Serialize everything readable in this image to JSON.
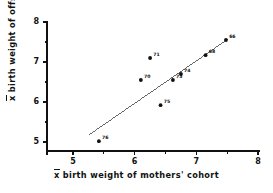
{
  "chart_data": {
    "type": "scatter",
    "title": "",
    "xlabel": "x̄ birth weight of mothers' cohort",
    "ylabel": "x̄ birth weight of offspring",
    "xlabel_parts": {
      "bar": "x",
      "rest": " birth weight of mothers' cohort"
    },
    "ylabel_parts": {
      "bar": "x",
      "rest": " birth weight of offspring"
    },
    "xlim": [
      4.7,
      8.0
    ],
    "ylim": [
      4.75,
      8.0
    ],
    "xticks": [
      5,
      6,
      7,
      8
    ],
    "yticks": [
      5,
      6,
      7,
      8
    ],
    "xtick_labels": [
      "5",
      "6",
      "7",
      "8"
    ],
    "ytick_labels": [
      "5",
      "6",
      "7",
      "8"
    ],
    "minor_ticks": true,
    "grid": false,
    "legend": "none",
    "points": [
      {
        "label": "76",
        "x": 5.42,
        "y": 5.02
      },
      {
        "label": "70",
        "x": 6.1,
        "y": 6.55
      },
      {
        "label": "71",
        "x": 6.25,
        "y": 7.1
      },
      {
        "label": "75",
        "x": 6.42,
        "y": 5.92
      },
      {
        "label": "73",
        "x": 6.62,
        "y": 6.55
      },
      {
        "label": "74",
        "x": 6.75,
        "y": 6.7
      },
      {
        "label": "68",
        "x": 7.15,
        "y": 7.17
      },
      {
        "label": "66",
        "x": 7.48,
        "y": 7.55
      }
    ],
    "fit_line": {
      "name": "regression-line",
      "x_start": 5.26,
      "y_start": 5.18,
      "x_end": 7.52,
      "y_end": 7.58
    },
    "colors": {
      "axis": "#111111",
      "marker": "#111111",
      "line": "#555555",
      "background": "#ffffff"
    }
  }
}
